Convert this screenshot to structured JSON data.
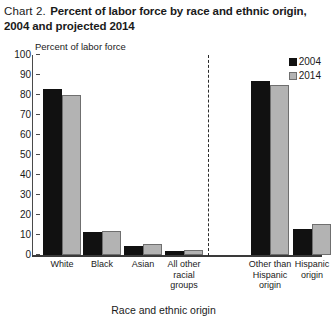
{
  "title": {
    "prefix": "Chart 2.",
    "main": "Percent of labor force by race and ethnic origin, 2004 and projected 2014"
  },
  "chart_data": {
    "type": "bar",
    "title": "Chart 2. Percent of labor force by race and ethnic origin, 2004 and projected 2014",
    "xlabel": "Race and ethnic origin",
    "ylabel": "Percent of labor force",
    "ylim": [
      0,
      100
    ],
    "yticks": [
      0,
      10,
      20,
      30,
      40,
      50,
      60,
      70,
      80,
      90,
      100
    ],
    "grid": false,
    "legend_position": "top-right",
    "categories": [
      "White",
      "Black",
      "Asian",
      "All other\nracial\ngroups",
      "Other than\nHispanic\norigin",
      "Hispanic\norigin"
    ],
    "series": [
      {
        "name": "2004",
        "color": "#111111",
        "values": [
          83,
          11.5,
          4.5,
          2,
          87,
          13
        ]
      },
      {
        "name": "2014",
        "color": "#b3b3b3",
        "values": [
          80,
          12,
          5.5,
          2.5,
          85,
          15.5
        ]
      }
    ],
    "annotations": [
      {
        "type": "vertical-dashed-divider",
        "after_category": "All other racial groups"
      }
    ]
  }
}
